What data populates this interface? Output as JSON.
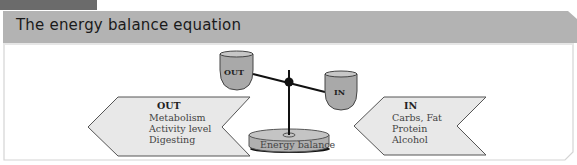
{
  "header": {
    "title": "The energy balance equation"
  },
  "diagram": {
    "scale": {
      "left_cup_label": "OUT",
      "right_cup_label": "IN",
      "base_label": "Energy balance"
    },
    "out_arrow": {
      "heading": "OUT",
      "items": [
        "Metabolism",
        "Activity level",
        "Digesting"
      ]
    },
    "in_arrow": {
      "heading": "IN",
      "items": [
        "Carbs, Fat",
        "Protein",
        "Alcohol"
      ]
    }
  },
  "colors": {
    "tab": "#6b6b6b",
    "header_bg": "#b3b3b3",
    "arrow_fill": "#e8e8e8",
    "cup_fill": "#a9a9a9",
    "border": "#d0d0d0"
  }
}
